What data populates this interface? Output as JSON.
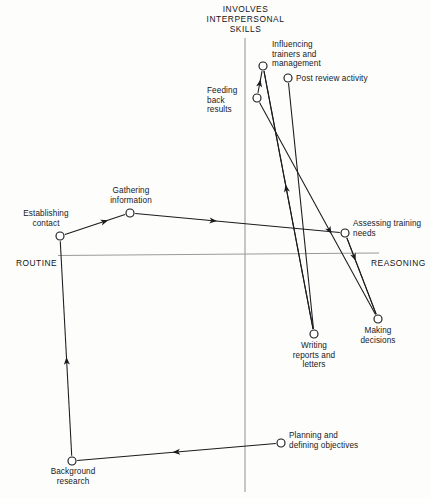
{
  "diagram": {
    "title": "INVOLVES\nINTERPERSONAL\nSKILLS",
    "axes": {
      "vertical_top_label": "INVOLVES INTERPERSONAL SKILLS",
      "horizontal_left_label": "ROUTINE",
      "horizontal_right_label": "REASONING",
      "line_color": "#8f8f8f"
    },
    "style": {
      "edge_color": "#1b1b1f",
      "node_stroke": "#1b1b1f",
      "node_fill": "#ffffff",
      "background": "#fdfdfb"
    },
    "nodes": [
      {
        "id": "establishing_contact",
        "label": "Establishing\ncontact",
        "x": 60,
        "y": 236,
        "label_x": 14,
        "label_y": 209,
        "align": "ctr",
        "width": 64
      },
      {
        "id": "gathering_information",
        "label": "Gathering\ninformation",
        "x": 130,
        "y": 213,
        "label_x": 98,
        "label_y": 186,
        "align": "ctr",
        "width": 66
      },
      {
        "id": "feeding_back_results",
        "label": "Feeding\nback\nresults",
        "x": 257,
        "y": 98,
        "label_x": 207,
        "label_y": 86,
        "align": "lf",
        "width": 42
      },
      {
        "id": "influencing_trainers",
        "label": "Influencing\ntrainers and\nmanagement",
        "x": 263,
        "y": 66,
        "label_x": 272,
        "label_y": 40,
        "align": "lf",
        "width": 66
      },
      {
        "id": "post_review_activity",
        "label": "Post review activity",
        "x": 288,
        "y": 78,
        "label_x": 296,
        "label_y": 74,
        "align": "lf",
        "width": 88
      },
      {
        "id": "assessing_training",
        "label": "Assessing training\nneeds",
        "x": 345,
        "y": 233,
        "label_x": 353,
        "label_y": 219,
        "align": "lf",
        "width": 76
      },
      {
        "id": "writing_reports",
        "label": "Writing\nreports and\nletters",
        "x": 314,
        "y": 334,
        "label_x": 279,
        "label_y": 341,
        "align": "ctr",
        "width": 70
      },
      {
        "id": "making_decisions",
        "label": "Making\ndecisions",
        "x": 378,
        "y": 319,
        "label_x": 347,
        "label_y": 326,
        "align": "ctr",
        "width": 62
      },
      {
        "id": "planning_objectives",
        "label": "Planning and\ndefining objectives",
        "x": 281,
        "y": 443,
        "label_x": 289,
        "label_y": 431,
        "align": "lf",
        "width": 84
      },
      {
        "id": "background_research",
        "label": "Background\nresearch",
        "x": 72,
        "y": 461,
        "label_x": 42,
        "label_y": 467,
        "align": "ctr",
        "width": 62
      }
    ],
    "edges": [
      {
        "id": "planning-to-background",
        "from": "planning_objectives",
        "to": "background_research",
        "arrow_at": 0.52
      },
      {
        "id": "background-to-establishing",
        "from": "background_research",
        "to": "establishing_contact",
        "arrow_at": 0.46
      },
      {
        "id": "establishing-to-gathering",
        "from": "establishing_contact",
        "to": "gathering_information",
        "arrow_at": 0.72
      },
      {
        "id": "gathering-to-assessing",
        "from": "gathering_information",
        "to": "assessing_training",
        "arrow_at": 0.4
      },
      {
        "id": "feeding-to-influencing",
        "from": "feeding_back_results",
        "to": "influencing_trainers",
        "arrow_at": 0.62
      },
      {
        "id": "influencing-to-writing",
        "from": "influencing_trainers",
        "to": "writing_reports",
        "arrow_at": 0.0
      },
      {
        "id": "feeding-to-making",
        "from": "feeding_back_results",
        "to": "making_decisions",
        "arrow_at": 0.62
      },
      {
        "id": "writing-to-influencing",
        "from": "writing_reports",
        "to": "influencing_trainers",
        "arrow_at": 0.56
      },
      {
        "id": "postreview-to-writing",
        "from": "post_review_activity",
        "to": "writing_reports",
        "arrow_at": 0.0
      },
      {
        "id": "assessing-to-making",
        "from": "assessing_training",
        "to": "making_decisions",
        "arrow_at": 0.3
      },
      {
        "id": "making-to-assessing",
        "from": "making_decisions",
        "to": "assessing_training",
        "arrow_at": 0.0
      }
    ]
  }
}
